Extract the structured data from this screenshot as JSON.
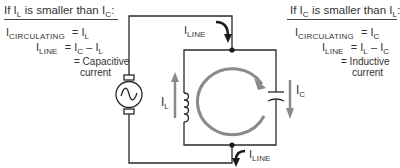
{
  "left_panel": {
    "heading_prefix": "If I",
    "heading_sub1": "L",
    "heading_mid": " is smaller than I",
    "heading_sub2": "C",
    "heading_suffix": ":",
    "row1": {
      "lhs_main": "I",
      "lhs_sub": "CIRCULATING",
      "eq": "= I",
      "rhs_sub": "L"
    },
    "row2": {
      "lhs_main": "I",
      "lhs_sub": "LINE",
      "eq": "= I",
      "rhs_sub1": "C",
      "minus": " – I",
      "rhs_sub2": "L"
    },
    "row3": "= Capacitive",
    "row4": "current"
  },
  "right_panel": {
    "heading_prefix": "If I",
    "heading_sub1": "C",
    "heading_mid": " is smaller than I",
    "heading_sub2": "L",
    "heading_suffix": ":",
    "row1": {
      "lhs_main": "I",
      "lhs_sub": "CIRCULATING",
      "eq": "= I",
      "rhs_sub": "C"
    },
    "row2": {
      "lhs_main": "I",
      "lhs_sub": "LINE",
      "eq": "= I",
      "rhs_sub1": "L",
      "minus": " – I",
      "rhs_sub2": "C"
    },
    "row3": "= Inductive",
    "row4": "current"
  },
  "circuit": {
    "iline_top": {
      "main": "I",
      "sub": "LINE"
    },
    "iline_bottom": {
      "main": "I",
      "sub": "LINE"
    },
    "il_label": {
      "main": "I",
      "sub": "L"
    },
    "ic_label": {
      "main": "I",
      "sub": "C"
    },
    "components": [
      "ac-generator-icon",
      "inductor-coil-icon",
      "capacitor-icon"
    ],
    "colors": {
      "wire": "#2a2a2a",
      "arrow_gray": "#8a8a8a"
    }
  }
}
